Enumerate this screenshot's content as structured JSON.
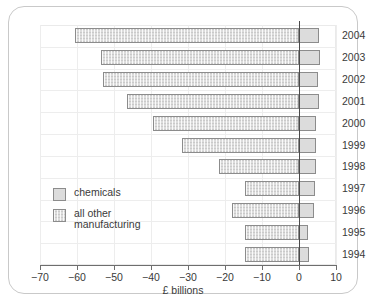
{
  "chart_data": {
    "type": "bar",
    "orientation": "horizontal",
    "title": "",
    "xlabel": "£ billions",
    "ylabel": "",
    "xlim": [
      -70,
      10
    ],
    "xticks": [
      -70,
      -60,
      -50,
      -40,
      -30,
      -20,
      -10,
      0,
      10
    ],
    "xtick_labels": [
      "−70",
      "−60",
      "−50",
      "−40",
      "−30",
      "−20",
      "−10",
      "0",
      "10"
    ],
    "grid": true,
    "legend_position": "inside-left",
    "categories": [
      "2004",
      "2003",
      "2002",
      "2001",
      "2000",
      "1999",
      "1998",
      "1997",
      "1996",
      "1995",
      "1994"
    ],
    "series": [
      {
        "name": "all other manufacturing",
        "key": "other",
        "values": [
          -60.5,
          -53.5,
          -53.0,
          -46.5,
          -39.5,
          -31.5,
          -21.5,
          -14.5,
          -18.0,
          -14.5,
          -14.5
        ]
      },
      {
        "name": "chemicals",
        "key": "chem",
        "values": [
          5.5,
          5.8,
          5.0,
          5.5,
          4.5,
          4.7,
          4.7,
          4.2,
          4.0,
          2.5,
          2.8
        ]
      }
    ],
    "bars": [
      {
        "category": "2004",
        "start": -60.5,
        "end": 5.5
      },
      {
        "category": "2003",
        "start": -53.5,
        "end": 5.8
      },
      {
        "category": "2002",
        "start": -53.0,
        "end": 5.0
      },
      {
        "category": "2001",
        "start": -46.5,
        "end": 5.5
      },
      {
        "category": "2000",
        "start": -39.5,
        "end": 4.5
      },
      {
        "category": "1999",
        "start": -31.5,
        "end": 4.7
      },
      {
        "category": "1998",
        "start": -21.5,
        "end": 4.7
      },
      {
        "category": "1997",
        "start": -14.5,
        "end": 4.2
      },
      {
        "category": "1996",
        "start": -18.0,
        "end": 4.0
      },
      {
        "category": "1995",
        "start": -14.5,
        "end": 2.5
      },
      {
        "category": "1994",
        "start": -14.5,
        "end": 2.8
      }
    ]
  },
  "legend": {
    "items": [
      {
        "label": "chemicals",
        "key": "chem"
      },
      {
        "label": "all other\nmanufacturing",
        "key": "other"
      }
    ]
  },
  "colors": {
    "bar_fill": "#dcdcdc",
    "bar_stroke": "#8c8c8c",
    "grid": "#ededed",
    "axis": "#6e6e6e",
    "zero_axis": "#4a4a4a",
    "text": "#3a3a3a",
    "card_border": "#c9c9c9"
  }
}
